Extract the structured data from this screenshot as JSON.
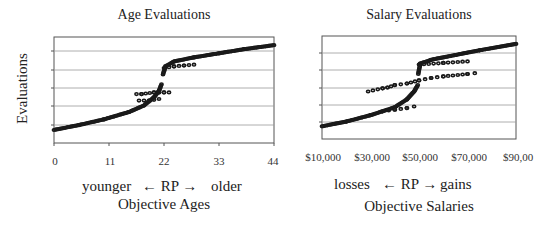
{
  "chart_data": [
    {
      "type": "scatter",
      "title": "Age Evaluations",
      "ylabel": "Evaluations",
      "xlabel_direction": {
        "left": "younger",
        "center": "← RP →",
        "right": "older"
      },
      "xlabel": "Objective Ages",
      "x_ticks": [
        "0",
        "11",
        "22",
        "33",
        "44"
      ],
      "xlim": [
        0,
        44
      ],
      "y_ticks_labeled": false,
      "gridlines": 5,
      "grid": true,
      "reference_point": 22,
      "series": [
        {
          "name": "lower-arm",
          "x": [
            0,
            5,
            10,
            15,
            18,
            20,
            21,
            21.5
          ],
          "y": [
            0.8,
            1.1,
            1.45,
            1.9,
            2.3,
            2.8,
            3.2,
            3.6
          ]
        },
        {
          "name": "upper-arm",
          "x": [
            21.8,
            22.3,
            24,
            28,
            33,
            38,
            44
          ],
          "y": [
            4.2,
            4.7,
            5.0,
            5.25,
            5.5,
            5.75,
            6.0
          ]
        },
        {
          "name": "loss-flat-band",
          "x": [
            17,
            19,
            21
          ],
          "y": [
            2.6,
            2.6,
            2.7
          ]
        },
        {
          "name": "rp-midband",
          "x": [
            16.5,
            17.5,
            20,
            21,
            22,
            23
          ],
          "y": [
            3.0,
            3.0,
            3.1,
            3.1,
            3.1,
            3.1
          ]
        },
        {
          "name": "gain-flat-band",
          "x": [
            22,
            24,
            26,
            28
          ],
          "y": [
            4.6,
            4.7,
            4.75,
            4.8
          ]
        }
      ],
      "ylim": [
        0,
        6.5
      ]
    },
    {
      "type": "scatter",
      "title": "Salary Evaluations",
      "ylabel": "",
      "xlabel_direction": {
        "left": "losses",
        "center": "← RP →",
        "right": "gains"
      },
      "xlabel": "Objective Salaries",
      "x_ticks": [
        "$10,000",
        "$30,000",
        "$50,000",
        "$70,000",
        "$90,00"
      ],
      "xlim": [
        10000,
        90000
      ],
      "y_ticks_labeled": false,
      "gridlines": 5,
      "grid": true,
      "reference_point": 50000,
      "series": [
        {
          "name": "lower-arm",
          "x": [
            10000,
            20000,
            30000,
            40000,
            45000,
            48000,
            49500
          ],
          "y": [
            0.8,
            1.1,
            1.5,
            2.0,
            2.5,
            3.0,
            3.4
          ]
        },
        {
          "name": "upper-arm",
          "x": [
            49700,
            50500,
            55000,
            65000,
            75000,
            90000
          ],
          "y": [
            4.1,
            4.75,
            5.0,
            5.3,
            5.6,
            6.0
          ]
        },
        {
          "name": "loss-flat-band",
          "x": [
            35000,
            40000,
            45000,
            48000
          ],
          "y": [
            1.75,
            1.85,
            1.95,
            2.05
          ]
        },
        {
          "name": "rp-midband",
          "x": [
            29000,
            35000,
            37000,
            40000,
            45000,
            50000,
            55000,
            60000,
            70000,
            73000
          ],
          "y": [
            3.0,
            3.2,
            3.25,
            3.4,
            3.5,
            3.7,
            3.85,
            3.95,
            4.1,
            4.15
          ]
        },
        {
          "name": "gain-flat-band",
          "x": [
            50000,
            60000,
            70000
          ],
          "y": [
            4.7,
            4.8,
            4.9
          ]
        }
      ],
      "ylim": [
        0,
        6.5
      ]
    }
  ],
  "left": {
    "title": "Age Evaluations",
    "ylabel": "Evaluations",
    "ticks": [
      "0",
      "11",
      "22",
      "33",
      "44"
    ],
    "dir_left": "younger",
    "dir_center": "← RP →",
    "dir_right": "older",
    "xlabel": "Objective Ages"
  },
  "right": {
    "title": "Salary Evaluations",
    "ticks": [
      "$10,000",
      "$30,000",
      "$50,000",
      "$70,000",
      "$90,00"
    ],
    "dir_left": "losses",
    "dir_center": "← RP →",
    "dir_right": "gains",
    "xlabel": "Objective Salaries"
  },
  "colors": {
    "marker": "#1a1a1a",
    "grid": "#9a9a9a",
    "axis": "#555555"
  }
}
